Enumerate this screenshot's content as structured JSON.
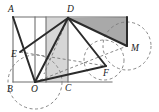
{
  "figure": {
    "canvas": {
      "width": 159,
      "height": 112
    },
    "colors": {
      "stroke_solid": "#2b2b2b",
      "stroke_dashed": "#7a7a7a",
      "stroke_thin": "#6f6f6f",
      "shade_light": "#d6d6d6",
      "shade_dark": "#a9a9a9",
      "label": "#1a1a1a",
      "background": "#ffffff"
    },
    "points": [
      {
        "name": "A",
        "label": "A",
        "x": 13,
        "y": 17,
        "label_x": 8,
        "label_y": 12
      },
      {
        "name": "D",
        "label": "D",
        "x": 68,
        "y": 18,
        "label_x": 67,
        "label_y": 12
      },
      {
        "name": "B",
        "label": "B",
        "x": 13,
        "y": 82,
        "label_x": 7,
        "label_y": 92
      },
      {
        "name": "O",
        "label": "O",
        "x": 35,
        "y": 82,
        "label_x": 31,
        "label_y": 92
      },
      {
        "name": "C",
        "label": "C",
        "x": 68,
        "y": 82,
        "label_x": 65,
        "label_y": 91
      },
      {
        "name": "E",
        "label": "E",
        "x": 20,
        "y": 52,
        "label_x": 11,
        "label_y": 57
      },
      {
        "name": "F",
        "label": "F",
        "x": 106,
        "y": 66,
        "label_x": 103,
        "label_y": 76
      },
      {
        "name": "M",
        "label": "M",
        "x": 127,
        "y": 46,
        "label_x": 131,
        "label_y": 51
      },
      {
        "name": "K",
        "label": "",
        "x": 127,
        "y": 17,
        "label_x": 0,
        "label_y": 0
      }
    ],
    "shaded_regions": [
      {
        "name": "triangle-D-O-vertical-light",
        "fill": "shade_light",
        "path": "M 68,18 L 46,18 L 46,82 L 68,82 Z"
      },
      {
        "name": "triangle-D-K-M-dark",
        "fill": "shade_dark",
        "path": "M 68,18 L 127,17 L 127,46 Z"
      }
    ],
    "solid_lines": [
      {
        "name": "segment-A-O",
        "x1": 13,
        "y1": 17,
        "x2": 35,
        "y2": 82
      },
      {
        "name": "segment-E-D",
        "x1": 20,
        "y1": 52,
        "x2": 68,
        "y2": 18
      },
      {
        "name": "segment-D-O",
        "x1": 68,
        "y1": 18,
        "x2": 35,
        "y2": 82
      },
      {
        "name": "segment-D-F",
        "x1": 68,
        "y1": 18,
        "x2": 106,
        "y2": 66
      },
      {
        "name": "segment-D-M",
        "x1": 68,
        "y1": 18,
        "x2": 127,
        "y2": 46
      },
      {
        "name": "segment-O-F",
        "x1": 35,
        "y1": 82,
        "x2": 106,
        "y2": 66
      },
      {
        "name": "segment-K-M",
        "x1": 127,
        "y1": 17,
        "x2": 127,
        "y2": 46
      }
    ],
    "thin_lines": [
      {
        "name": "rect-top-A-K",
        "x1": 13,
        "y1": 17,
        "x2": 127,
        "y2": 17
      },
      {
        "name": "rect-bottom-B-F",
        "x1": 13,
        "y1": 82,
        "x2": 112,
        "y2": 82
      },
      {
        "name": "rect-left-A-B",
        "x1": 13,
        "y1": 17,
        "x2": 13,
        "y2": 82
      },
      {
        "name": "vertical-mid-O",
        "x1": 35,
        "y1": 17,
        "x2": 35,
        "y2": 82
      },
      {
        "name": "vertical-left-mid",
        "x1": 46,
        "y1": 17,
        "x2": 46,
        "y2": 82
      },
      {
        "name": "vertical-D-C",
        "x1": 68,
        "y1": 17,
        "x2": 68,
        "y2": 82
      }
    ],
    "dashed_lines": [
      {
        "name": "dashed-E-F",
        "x1": 20,
        "y1": 52,
        "x2": 106,
        "y2": 66
      },
      {
        "name": "dashed-O-M",
        "x1": 35,
        "y1": 82,
        "x2": 127,
        "y2": 46
      },
      {
        "name": "dashed-D-Omid",
        "x1": 68,
        "y1": 18,
        "x2": 44,
        "y2": 74
      }
    ],
    "dashed_circles": [
      {
        "name": "circle-center-O",
        "cx": 35,
        "cy": 82,
        "r": 27
      },
      {
        "name": "circle-center-M",
        "cx": 127,
        "cy": 46,
        "r": 24
      },
      {
        "name": "circle-center-F",
        "cx": 104,
        "cy": 60,
        "r": 20
      }
    ]
  }
}
